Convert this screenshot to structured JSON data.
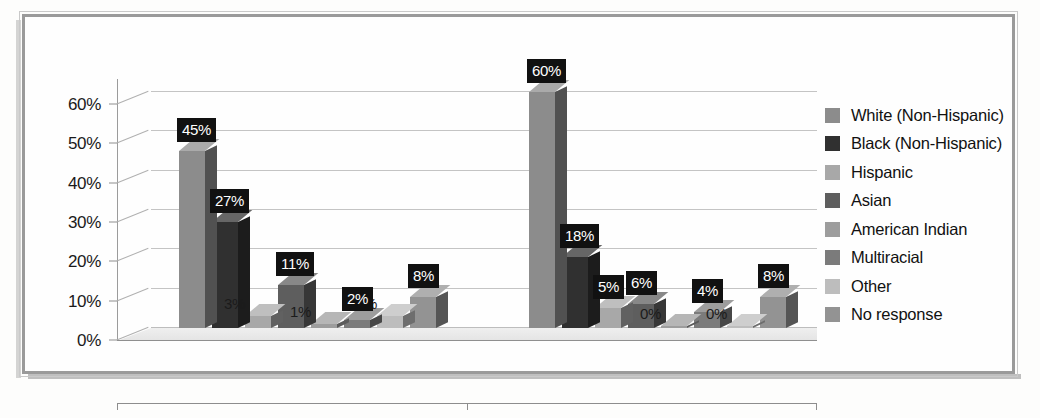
{
  "figure": {
    "frame_border_color": "#9a9a9a",
    "background_color": "#fefefe"
  },
  "chart_data": {
    "type": "bar",
    "title": "",
    "subtitle": "",
    "xlabel": "",
    "ylabel": "",
    "categories": [
      "Total Student Enrollment",
      "Total GSU Students Studying Abroad"
    ],
    "series": [
      {
        "name": "White (Non-Hispanic)",
        "color": "#8c8c8c",
        "values": [
          45,
          60
        ]
      },
      {
        "name": "Black (Non-Hispanic)",
        "color": "#303030",
        "values": [
          27,
          18
        ]
      },
      {
        "name": "Hispanic",
        "color": "#a8a8a8",
        "values": [
          3,
          5
        ]
      },
      {
        "name": "Asian",
        "color": "#5e5e5e",
        "values": [
          11,
          6
        ]
      },
      {
        "name": "American Indian",
        "color": "#9d9d9d",
        "values": [
          1,
          0
        ]
      },
      {
        "name": "Multiracial",
        "color": "#7b7b7b",
        "values": [
          2,
          4
        ]
      },
      {
        "name": "Other",
        "color": "#bdbdbd",
        "values": [
          3,
          0
        ]
      },
      {
        "name": "No response",
        "color": "#939393",
        "values": [
          8,
          8
        ]
      }
    ],
    "value_labels": [
      [
        "45%",
        "27%",
        "3%",
        "11%",
        "1%",
        "2%",
        "3%",
        "8%"
      ],
      [
        "60%",
        "18%",
        "5%",
        "6%",
        "0%",
        "4%",
        "0%",
        "8%"
      ]
    ],
    "ylim": [
      0,
      60
    ],
    "ytick_values": [
      0,
      10,
      20,
      30,
      40,
      50,
      60
    ],
    "ytick_labels": [
      "0%",
      "10%",
      "20%",
      "30%",
      "40%",
      "50%",
      "60%"
    ],
    "grid": true,
    "grid_axis": "y",
    "legend_position": "right",
    "three_d": true,
    "value_label_style": "white text on black box"
  },
  "legend": {
    "items": [
      {
        "label": "White (Non-Hispanic)",
        "color": "#8c8c8c"
      },
      {
        "label": "Black (Non-Hispanic)",
        "color": "#303030"
      },
      {
        "label": "Hispanic",
        "color": "#a8a8a8"
      },
      {
        "label": "Asian",
        "color": "#5e5e5e"
      },
      {
        "label": "American Indian",
        "color": "#9d9d9d"
      },
      {
        "label": "Multiracial",
        "color": "#7b7b7b"
      },
      {
        "label": "Other",
        "color": "#bdbdbd"
      },
      {
        "label": "No response",
        "color": "#939393"
      }
    ]
  }
}
